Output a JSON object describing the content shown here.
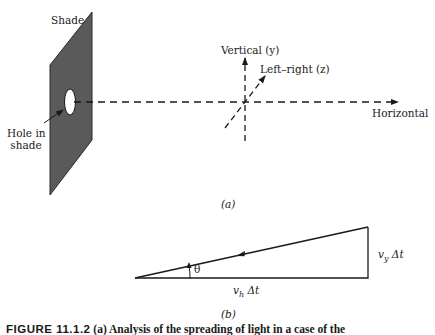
{
  "figure": {
    "panel_a": {
      "label": "(a)",
      "shade_label": "Shade",
      "hole_label_line1": "Hole in",
      "hole_label_line2": "shade",
      "axes": {
        "vertical": "Vertical (y)",
        "left_right": "Left–right (z)",
        "horizontal": "Horizontal"
      }
    },
    "panel_b": {
      "label": "(b)",
      "angle": "θ",
      "vertical_side": "v_y Δt",
      "vertical_side_main": "v",
      "vertical_side_sub": "y",
      "vertical_side_tail": " Δt",
      "horizontal_side_main": "v",
      "horizontal_side_sub": "h",
      "horizontal_side_tail": " Δt"
    },
    "caption": {
      "number": "FIGURE 11.1.2",
      "text": "(a) Analysis of the spreading of light in a case of the"
    },
    "colors": {
      "shade_fill": "#5a5a5a",
      "line": "#1a1a1a",
      "background": "#ffffff"
    }
  }
}
